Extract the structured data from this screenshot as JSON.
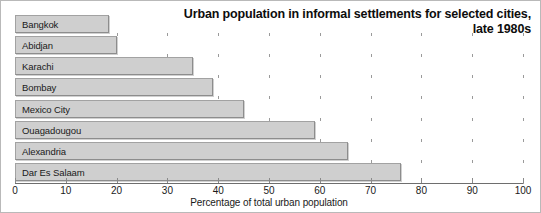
{
  "chart_data": {
    "type": "bar",
    "orientation": "horizontal",
    "title": "Urban population in informal settlements for selected cities, late 1980s",
    "title_line_1": "Urban population in informal settlements for selected cities,",
    "title_line_2": "late 1980s",
    "categories": [
      "Bangkok",
      "Abidjan",
      "Karachi",
      "Bombay",
      "Mexico City",
      "Ouagadougou",
      "Alexandria",
      "Dar Es Salaam"
    ],
    "values": [
      18.5,
      20,
      35,
      39,
      45,
      59,
      65.5,
      76
    ],
    "xlabel": "Percentage of total urban population",
    "ylabel": "",
    "xlim": [
      0,
      100
    ],
    "xticks": [
      0,
      10,
      20,
      30,
      40,
      50,
      60,
      70,
      80,
      90,
      100
    ],
    "xtick_labels": [
      "0",
      "10",
      "20",
      "30",
      "40",
      "50",
      "60",
      "70",
      "80",
      "90",
      "100"
    ],
    "grid": false,
    "legend": null,
    "bar_color": "#cfcfcf",
    "bar_border_color": "#8d8d8d",
    "text_color": "#1a1a1a",
    "background": "#ffffff"
  }
}
